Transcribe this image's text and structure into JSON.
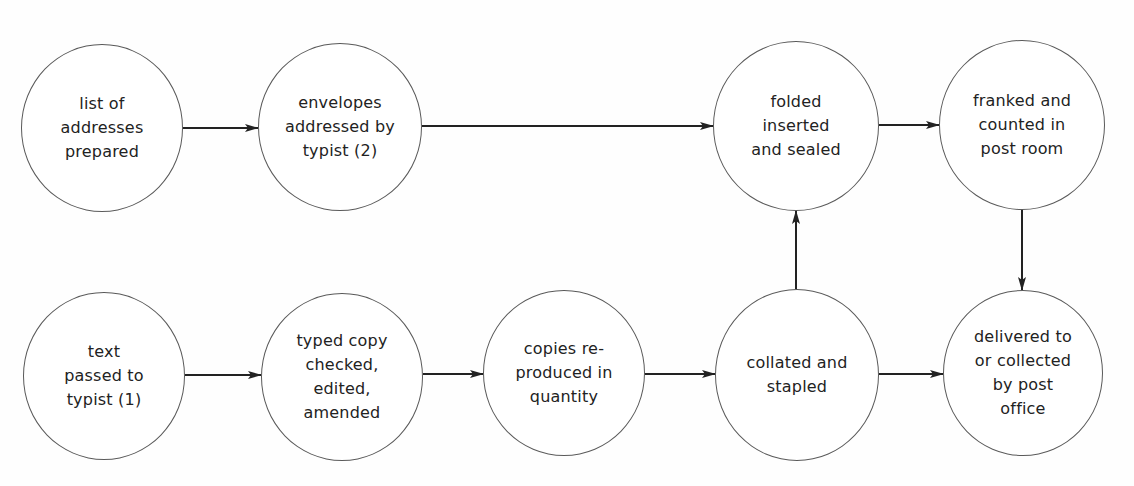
{
  "diagram": {
    "type": "flowchart",
    "nodes": [
      {
        "id": "n1",
        "label": "list of\naddresses\nprepared",
        "cx": 102,
        "cy": 128,
        "rx": 81,
        "ry": 84
      },
      {
        "id": "n2",
        "label": "envelopes\naddressed by\ntypist (2)",
        "cx": 340,
        "cy": 127,
        "rx": 82,
        "ry": 84
      },
      {
        "id": "n3",
        "label": "folded\ninserted\nand sealed",
        "cx": 796,
        "cy": 126,
        "rx": 83,
        "ry": 85
      },
      {
        "id": "n4",
        "label": "franked and\ncounted in\npost room",
        "cx": 1022,
        "cy": 125,
        "rx": 83,
        "ry": 85
      },
      {
        "id": "n5",
        "label": "text\npassed to\ntypist (1)",
        "cx": 104,
        "cy": 376,
        "rx": 81,
        "ry": 84
      },
      {
        "id": "n6",
        "label": "typed copy\nchecked,\nedited,\namended",
        "cx": 342,
        "cy": 377,
        "rx": 81,
        "ry": 84
      },
      {
        "id": "n7",
        "label": "copies re-\nproduced in\nquantity",
        "cx": 564,
        "cy": 373,
        "rx": 81,
        "ry": 83
      },
      {
        "id": "n8",
        "label": "collated and\nstapled",
        "cx": 797,
        "cy": 375,
        "rx": 82,
        "ry": 86
      },
      {
        "id": "n9",
        "label": "delivered to\nor collected\nby post\noffice",
        "cx": 1023,
        "cy": 373,
        "rx": 80,
        "ry": 83
      }
    ],
    "edges": [
      {
        "from": "n1",
        "to": "n2",
        "x1": 183,
        "y1": 128,
        "x2": 258,
        "y2": 128
      },
      {
        "from": "n2",
        "to": "n3",
        "x1": 422,
        "y1": 126,
        "x2": 713,
        "y2": 126
      },
      {
        "from": "n3",
        "to": "n4",
        "x1": 879,
        "y1": 125,
        "x2": 939,
        "y2": 125
      },
      {
        "from": "n4",
        "to": "n9",
        "x1": 1022,
        "y1": 210,
        "x2": 1022,
        "y2": 290
      },
      {
        "from": "n5",
        "to": "n6",
        "x1": 185,
        "y1": 375,
        "x2": 261,
        "y2": 375
      },
      {
        "from": "n6",
        "to": "n7",
        "x1": 423,
        "y1": 374,
        "x2": 483,
        "y2": 374
      },
      {
        "from": "n7",
        "to": "n8",
        "x1": 645,
        "y1": 374,
        "x2": 715,
        "y2": 374
      },
      {
        "from": "n8",
        "to": "n3",
        "x1": 796,
        "y1": 289,
        "x2": 796,
        "y2": 211
      },
      {
        "from": "n8",
        "to": "n9",
        "x1": 879,
        "y1": 374,
        "x2": 943,
        "y2": 374
      }
    ],
    "colors": {
      "node_border": "#5a5a5a",
      "edge": "#222222",
      "text": "#222222",
      "background": "#fefefe"
    }
  }
}
